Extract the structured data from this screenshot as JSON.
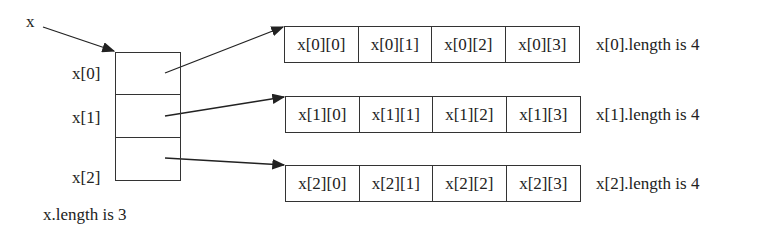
{
  "diagram": {
    "variable": "x",
    "outer_array": {
      "labels": [
        "x[0]",
        "x[1]",
        "x[2]"
      ],
      "length_label": "x.length is 3"
    },
    "rows": [
      {
        "cells": [
          "x[0][0]",
          "x[0][1]",
          "x[0][2]",
          "x[0][3]"
        ],
        "length_label": "x[0].length is 4"
      },
      {
        "cells": [
          "x[1][0]",
          "x[1][1]",
          "x[1][2]",
          "x[1][3]"
        ],
        "length_label": "x[1].length is 4"
      },
      {
        "cells": [
          "x[2][0]",
          "x[2][1]",
          "x[2][2]",
          "x[2][3]"
        ],
        "length_label": "x[2].length is 4"
      }
    ],
    "colors": {
      "stroke": "#333333",
      "text": "#222222",
      "background": "#ffffff"
    }
  }
}
